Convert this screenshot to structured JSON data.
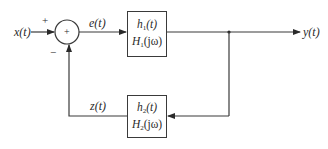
{
  "diagram": {
    "type": "feedback-block-diagram",
    "signals": {
      "input": "x(t)",
      "error": "e(t)",
      "output": "y(t)",
      "feedback": "z(t)"
    },
    "summing_junction": {
      "symbol": "+",
      "input_sign": "+",
      "feedback_sign": "−"
    },
    "forward_block": {
      "impulse_response_base": "h",
      "impulse_response_sub": "1",
      "impulse_response_arg": "(t)",
      "transfer_base": "H",
      "transfer_sub": "1",
      "transfer_arg": "(jω)"
    },
    "feedback_block": {
      "impulse_response_base": "h",
      "impulse_response_sub": "2",
      "impulse_response_arg": "(t)",
      "transfer_base": "H",
      "transfer_sub": "2",
      "transfer_arg": "(jω)"
    },
    "colors": {
      "stroke": "#3a3a3a",
      "text": "#2a2a2a",
      "background": "#ffffff"
    }
  }
}
